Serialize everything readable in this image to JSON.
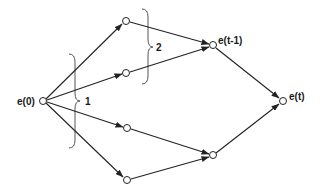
{
  "diagram": {
    "type": "directed-graph",
    "nodes": [
      {
        "id": "e0",
        "label": "e(0)",
        "x": 43,
        "y": 101
      },
      {
        "id": "a1",
        "label": "",
        "x": 126,
        "y": 21
      },
      {
        "id": "a2",
        "label": "",
        "x": 126,
        "y": 73
      },
      {
        "id": "a3",
        "label": "",
        "x": 127,
        "y": 128
      },
      {
        "id": "a4",
        "label": "",
        "x": 127,
        "y": 180
      },
      {
        "id": "et1",
        "label": "e(t-1)",
        "x": 213,
        "y": 45
      },
      {
        "id": "b2",
        "label": "",
        "x": 213,
        "y": 155
      },
      {
        "id": "et",
        "label": "e(t)",
        "x": 283,
        "y": 101
      }
    ],
    "edges": [
      {
        "from": "e0",
        "to": "a1"
      },
      {
        "from": "e0",
        "to": "a2"
      },
      {
        "from": "e0",
        "to": "a3"
      },
      {
        "from": "e0",
        "to": "a4"
      },
      {
        "from": "a1",
        "to": "et1"
      },
      {
        "from": "a2",
        "to": "et1"
      },
      {
        "from": "a3",
        "to": "b2"
      },
      {
        "from": "a4",
        "to": "b2"
      },
      {
        "from": "et1",
        "to": "et"
      },
      {
        "from": "b2",
        "to": "et"
      }
    ],
    "labels": {
      "e0": "e(0)",
      "et1": "e(t-1)",
      "et": "e(t)"
    },
    "braces": [
      {
        "label": "1",
        "x": 75,
        "y_top": 54,
        "y_bottom": 148,
        "y_tip": 101,
        "label_x": 88
      },
      {
        "label": "2",
        "x": 148,
        "y_top": 9,
        "y_bottom": 84,
        "y_tip": 47,
        "label_x": 157
      }
    ]
  }
}
